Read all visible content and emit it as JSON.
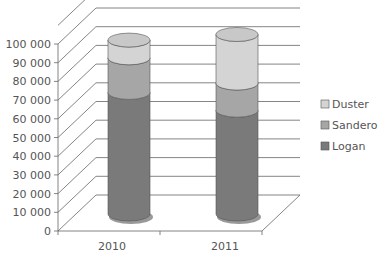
{
  "chart_data": {
    "type": "bar",
    "subtype": "3d-stacked-cylinder",
    "title": "",
    "xlabel": "",
    "ylabel": "",
    "categories": [
      "2010",
      "2011"
    ],
    "series": [
      {
        "name": "Logan",
        "values": [
          65000,
          55500
        ],
        "color": "#7a7a7a"
      },
      {
        "name": "Sandero",
        "values": [
          18500,
          14500
        ],
        "color": "#a6a6a6"
      },
      {
        "name": "Duster",
        "values": [
          9500,
          26000
        ],
        "color": "#d4d4d4"
      }
    ],
    "ylim": [
      0,
      110000
    ],
    "yticks": [
      "0",
      "10 000",
      "20 000",
      "30 000",
      "40 000",
      "50 000",
      "60 000",
      "70 000",
      "80 000",
      "90 000",
      "100 000"
    ],
    "grid": true,
    "legend": {
      "position": "right",
      "entries": [
        "Duster",
        "Sandero",
        "Logan"
      ]
    }
  }
}
